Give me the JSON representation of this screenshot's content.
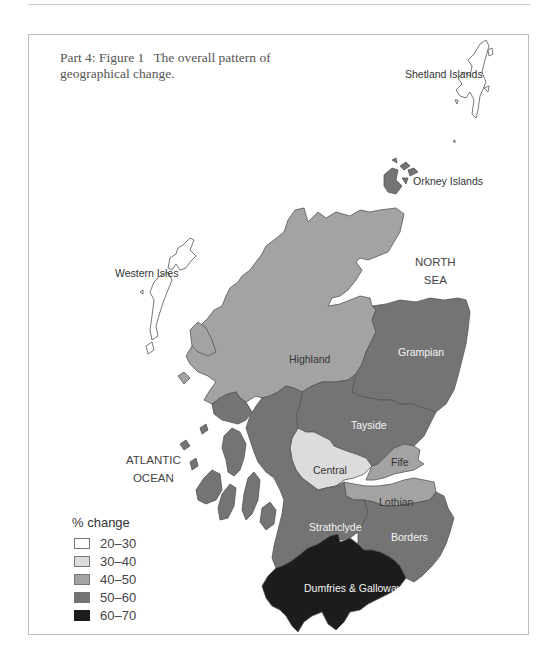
{
  "caption": {
    "figure": "Part 4: Figure 1",
    "title": "The overall pattern of geographical change."
  },
  "seas": {
    "north_sea": [
      "NORTH",
      "SEA"
    ],
    "atlantic": [
      "ATLANTIC",
      "OCEAN"
    ]
  },
  "legend": {
    "title": "% change",
    "items": [
      {
        "label": "20–30",
        "color": "#ffffff"
      },
      {
        "label": "30–40",
        "color": "#dcdcdc"
      },
      {
        "label": "40–50",
        "color": "#a3a3a3"
      },
      {
        "label": "50–60",
        "color": "#747474"
      },
      {
        "label": "60–70",
        "color": "#1c1c1c"
      }
    ]
  },
  "regions": [
    {
      "name": "Shetland Islands",
      "category": "20–30"
    },
    {
      "name": "Orkney Islands",
      "category": "50–60"
    },
    {
      "name": "Western Isles",
      "category": "20–30"
    },
    {
      "name": "Highland",
      "category": "40–50"
    },
    {
      "name": "Grampian",
      "category": "50–60"
    },
    {
      "name": "Tayside",
      "category": "50–60"
    },
    {
      "name": "Central",
      "category": "30–40"
    },
    {
      "name": "Fife",
      "category": "40–50"
    },
    {
      "name": "Lothian",
      "category": "40–50"
    },
    {
      "name": "Strathclyde",
      "category": "50–60"
    },
    {
      "name": "Borders",
      "category": "50–60"
    },
    {
      "name": "Dumfries & Galloway",
      "category": "60–70"
    }
  ],
  "labels": {
    "shetland": "Shetland Islands",
    "orkney": "Orkney Islands",
    "western_isles": "Western Isles",
    "highland": "Highland",
    "grampian": "Grampian",
    "tayside": "Tayside",
    "central": "Central",
    "fife": "Fife",
    "lothian": "Lothian",
    "strathclyde": "Strathclyde",
    "borders": "Borders",
    "dumfries": "Dumfries & Galloway"
  }
}
